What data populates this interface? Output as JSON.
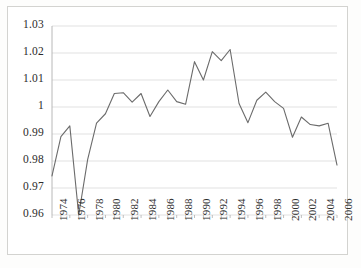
{
  "chart_data": {
    "type": "line",
    "title": "",
    "subtitle": "",
    "xlabel": "",
    "ylabel": "",
    "xlim": [
      1974,
      2006
    ],
    "ylim": [
      0.96,
      1.03
    ],
    "grid": true,
    "grid_axis": "y",
    "legend": false,
    "legend_position": "none",
    "line_color": "#6b6b6b",
    "series": [
      {
        "name": "series-1",
        "x": [
          1974,
          1975,
          1976,
          1977,
          1978,
          1979,
          1980,
          1981,
          1982,
          1983,
          1984,
          1985,
          1986,
          1987,
          1988,
          1989,
          1990,
          1991,
          1992,
          1993,
          1994,
          1995,
          1996,
          1997,
          1998,
          1999,
          2000,
          2001,
          2002,
          2003,
          2004,
          2005,
          2006
        ],
        "values": [
          0.9745,
          0.989,
          0.993,
          0.96,
          0.9805,
          0.994,
          0.9975,
          1.005,
          1.0053,
          1.0018,
          1.005,
          0.9965,
          1.002,
          1.0063,
          1.002,
          1.001,
          1.0168,
          1.01,
          1.0205,
          1.0172,
          1.0213,
          1.0013,
          0.9942,
          1.0025,
          1.0055,
          1.002,
          0.9995,
          0.9888,
          0.9963,
          0.9935,
          0.993,
          0.994,
          0.9785
        ]
      }
    ],
    "ytick_labels": [
      "1.03",
      "1.02",
      "1.01",
      "1",
      "0.99",
      "0.98",
      "0.97",
      "0.96"
    ],
    "ytick_values": [
      1.03,
      1.02,
      1.01,
      1.0,
      0.99,
      0.98,
      0.97,
      0.96
    ],
    "xtick_labels": [
      "1974",
      "1976",
      "1978",
      "1980",
      "1982",
      "1984",
      "1986",
      "1988",
      "1990",
      "1992",
      "1994",
      "1996",
      "1998",
      "2000",
      "2002",
      "2004",
      "2006"
    ],
    "xtick_values": [
      1974,
      1976,
      1978,
      1980,
      1982,
      1984,
      1986,
      1988,
      1990,
      1992,
      1994,
      1996,
      1998,
      2000,
      2002,
      2004,
      2006
    ]
  },
  "style": {
    "gridline_color": "#d9d9d9",
    "axis_color": "#b0b0b0",
    "plot_background": "#ffffff",
    "text_color": "#2b2b2b"
  }
}
